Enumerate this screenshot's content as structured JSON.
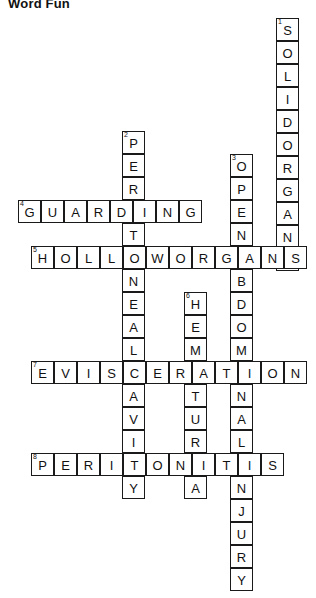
{
  "title": "Word Fun",
  "grid": {
    "cell_size": 23,
    "border_color": "#1a1a1a",
    "cell_fill": "#ffffff",
    "text_color": "#111111"
  },
  "entries": [
    {
      "number": "1",
      "direction": "down",
      "answer": "SOLIDORGANS",
      "length": 11,
      "x": 276,
      "y": 18,
      "letters": [
        "S",
        "O",
        "L",
        "I",
        "D",
        "O",
        "R",
        "G",
        "A",
        "N",
        "S"
      ]
    },
    {
      "number": "2",
      "direction": "down",
      "answer": "PERITONEALCAVITY",
      "length": 16,
      "x": 122,
      "y": 131,
      "letters": [
        "P",
        "E",
        "R",
        "I",
        "T",
        "O",
        "N",
        "E",
        "A",
        "L",
        "C",
        "A",
        "V",
        "I",
        "T",
        "Y"
      ]
    },
    {
      "number": "3",
      "direction": "down",
      "answer": "OPENABDOMINALINJURY",
      "length": 19,
      "x": 230,
      "y": 154,
      "letters": [
        "O",
        "P",
        "E",
        "N",
        "A",
        "B",
        "D",
        "O",
        "M",
        "I",
        "N",
        "A",
        "L",
        "I",
        "N",
        "J",
        "U",
        "R",
        "Y"
      ]
    },
    {
      "number": "4",
      "direction": "across",
      "answer": "GUARDING",
      "length": 8,
      "x": 18,
      "y": 200,
      "letters": [
        "G",
        "U",
        "A",
        "R",
        "D",
        "I",
        "N",
        "G"
      ]
    },
    {
      "number": "5",
      "direction": "across",
      "answer": "HOLLOWORGANS",
      "length": 12,
      "x": 31,
      "y": 246,
      "letters": [
        "H",
        "O",
        "L",
        "L",
        "O",
        "W",
        "O",
        "R",
        "G",
        "A",
        "N",
        "S"
      ]
    },
    {
      "number": "6",
      "direction": "down",
      "answer": "HEMATURIA",
      "length": 9,
      "x": 184,
      "y": 292,
      "letters": [
        "H",
        "E",
        "M",
        "A",
        "T",
        "U",
        "R",
        "I",
        "A"
      ]
    },
    {
      "number": "7",
      "direction": "across",
      "answer": "EVISCERATION",
      "length": 12,
      "x": 31,
      "y": 361,
      "letters": [
        "E",
        "V",
        "I",
        "S",
        "C",
        "E",
        "R",
        "A",
        "T",
        "I",
        "O",
        "N"
      ]
    },
    {
      "number": "8",
      "direction": "across",
      "answer": "PERITONITIS",
      "length": 11,
      "x": 31,
      "y": 453,
      "letters": [
        "P",
        "E",
        "R",
        "I",
        "T",
        "O",
        "N",
        "I",
        "T",
        "I",
        "S"
      ]
    }
  ]
}
